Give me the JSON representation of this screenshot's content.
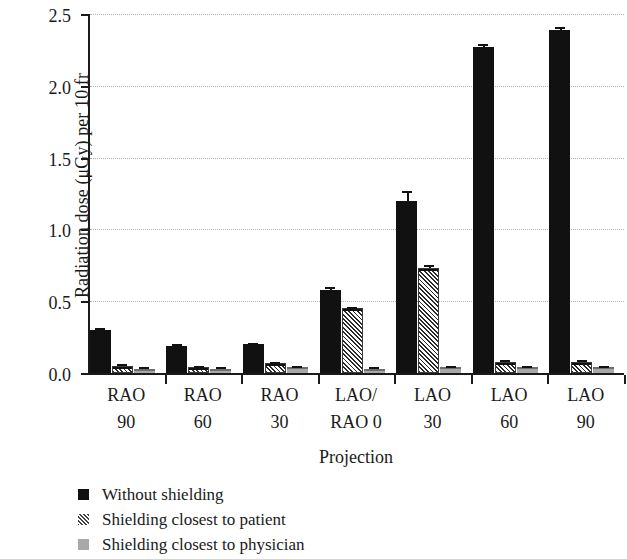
{
  "chart_data": {
    "type": "bar",
    "title": "",
    "xlabel": "Projection",
    "ylabel": "Radiation dose (μGy) per 10 fr",
    "categories": [
      "RAO 90",
      "RAO 60",
      "RAO 30",
      "LAO/RAO 0",
      "LAO 30",
      "LAO 60",
      "LAO 90"
    ],
    "category_lines": [
      {
        "line1": "RAO",
        "line2": "90"
      },
      {
        "line1": "RAO",
        "line2": "60"
      },
      {
        "line1": "RAO",
        "line2": "30"
      },
      {
        "line1": "LAO/",
        "line2": "RAO 0"
      },
      {
        "line1": "LAO",
        "line2": "30"
      },
      {
        "line1": "LAO",
        "line2": "60"
      },
      {
        "line1": "LAO",
        "line2": "90"
      }
    ],
    "series": [
      {
        "name": "Without shielding",
        "color": "#111111",
        "pattern": "solid",
        "values": [
          0.3,
          0.19,
          0.2,
          0.58,
          1.2,
          2.27,
          2.39
        ],
        "errors": [
          0.01,
          0.01,
          0.01,
          0.02,
          0.07,
          0.02,
          0.02
        ]
      },
      {
        "name": "Shielding closest to patient",
        "color": "#2a2a2a",
        "pattern": "hatched",
        "values": [
          0.05,
          0.04,
          0.07,
          0.45,
          0.73,
          0.08,
          0.08
        ],
        "errors": [
          0.01,
          0.01,
          0.01,
          0.01,
          0.02,
          0.01,
          0.01
        ]
      },
      {
        "name": "Shielding closest to physician",
        "color": "#a8a8a8",
        "pattern": "solid-grey",
        "values": [
          0.03,
          0.03,
          0.04,
          0.03,
          0.04,
          0.04,
          0.04
        ],
        "errors": [
          0.01,
          0.01,
          0.01,
          0.01,
          0.01,
          0.01,
          0.01
        ]
      }
    ],
    "ylim": [
      0.0,
      2.5
    ],
    "yticks": [
      "0.0",
      "0.5",
      "1.0",
      "1.5",
      "2.0",
      "2.5"
    ],
    "ytick_values": [
      0.0,
      0.5,
      1.0,
      1.5,
      2.0,
      2.5
    ],
    "grid": "horizontal-dotted",
    "legend_position": "below-left"
  },
  "legend": {
    "items": [
      {
        "label": "Without shielding",
        "marker": "solid-square-black"
      },
      {
        "label": "Shielding closest to patient",
        "marker": "hatched-square"
      },
      {
        "label": "Shielding closest to physician",
        "marker": "solid-square-grey"
      }
    ]
  }
}
